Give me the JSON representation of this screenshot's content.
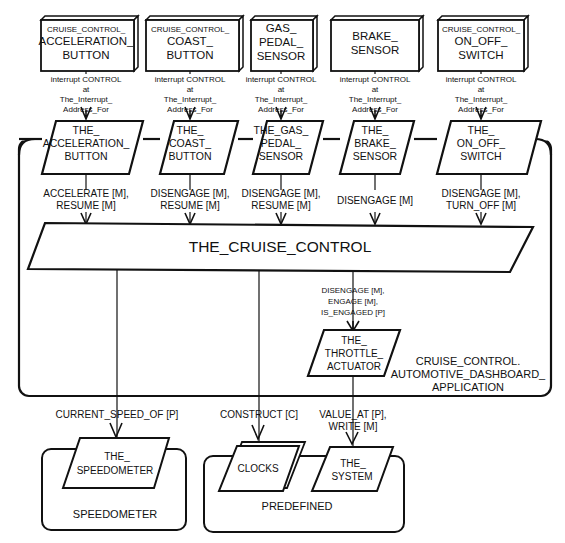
{
  "devices": [
    {
      "id": "acc",
      "lines": [
        "CRUISE_CONTROL_",
        "ACCELERATION_",
        "BUTTON"
      ],
      "small_first": true,
      "interrupt": [
        "interrupt CONTROL",
        "at",
        "The_Interrupt_",
        "Address_For"
      ]
    },
    {
      "id": "coast",
      "lines": [
        "CRUISE_CONTROL_",
        "COAST_",
        "BUTTON"
      ],
      "small_first": true,
      "interrupt": [
        "interrupt CONTROL",
        "at",
        "The_Interrupt_",
        "Address_For"
      ]
    },
    {
      "id": "gas",
      "lines": [
        "GAS_",
        "PEDAL_",
        "SENSOR"
      ],
      "small_first": false,
      "interrupt": [
        "interrupt CONTROL",
        "at",
        "The_Interrupt_",
        "Address_For"
      ]
    },
    {
      "id": "brake",
      "lines": [
        "BRAKE_",
        "SENSOR"
      ],
      "small_first": false,
      "interrupt": [
        "interrupt CONTROL",
        "at",
        "The_Interrupt_",
        "Address_For"
      ]
    },
    {
      "id": "onoff",
      "lines": [
        "CRUISE_CONTROL_",
        "ON_OFF_",
        "SWITCH"
      ],
      "small_first": true,
      "interrupt": [
        "interrupt CONTROL",
        "at",
        "The_Interrupt_",
        "Address_For"
      ]
    }
  ],
  "objects": [
    {
      "id": "acc",
      "lines": [
        "THE_",
        "ACCELERATION_",
        "BUTTON"
      ],
      "ops": [
        "ACCELERATE [M],",
        "RESUME [M]"
      ]
    },
    {
      "id": "coast",
      "lines": [
        "THE_",
        "COAST_",
        "BUTTON"
      ],
      "ops": [
        "DISENGAGE [M],",
        "RESUME [M]"
      ]
    },
    {
      "id": "gas",
      "lines": [
        "THE_GAS_",
        "PEDAL_",
        "SENSOR"
      ],
      "ops": [
        "DISENGAGE [M],",
        "RESUME [M]"
      ]
    },
    {
      "id": "brake",
      "lines": [
        "THE_",
        "BRAKE_",
        "SENSOR"
      ],
      "ops": [
        "DISENGAGE [M]"
      ]
    },
    {
      "id": "onoff",
      "lines": [
        "THE_",
        "ON_OFF_",
        "SWITCH"
      ],
      "ops": [
        "DISENGAGE [M],",
        "TURN_OFF [M]"
      ]
    }
  ],
  "cruise_control": {
    "label": "THE_CRUISE_CONTROL"
  },
  "throttle": {
    "lines": [
      "THE_",
      "THROTTLE_",
      "ACTUATOR"
    ],
    "ops": [
      "DISENGAGE [M],",
      "ENGAGE [M],",
      "IS_ENGAGED [P]"
    ]
  },
  "application": {
    "lines": [
      "CRUISE_CONTROL.",
      "AUTOMOTIVE_DASHBOARD_",
      "APPLICATION"
    ]
  },
  "links": {
    "speed": "CURRENT_SPEED_OF [P]",
    "construct": "CONSTRUCT [C]",
    "value": [
      "VALUE_AT [P],",
      "WRITE [M]"
    ]
  },
  "speedometer_pkg": {
    "label": "SPEEDOMETER",
    "object": [
      "THE_",
      "SPEEDOMETER"
    ]
  },
  "predefined_pkg": {
    "label": "PREDEFINED",
    "clocks": "CLOCKS",
    "system": [
      "THE_",
      "SYSTEM"
    ]
  }
}
